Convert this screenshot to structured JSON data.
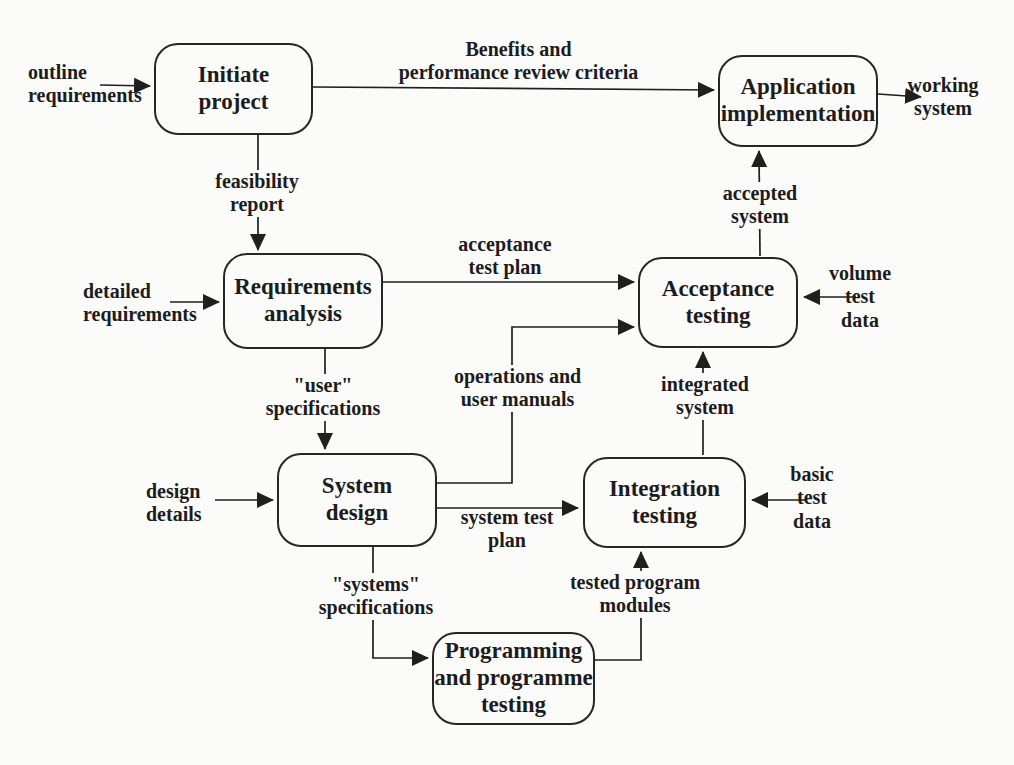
{
  "colors": {
    "ink": "#1f1f1f",
    "background": "#fbfbf9",
    "box_border": "#262626"
  },
  "nodes": {
    "initiate": {
      "label": "Initiate\nproject"
    },
    "application": {
      "label": "Application\nimplementation"
    },
    "requirements": {
      "label": "Requirements\nanalysis"
    },
    "acceptance": {
      "label": "Acceptance\ntesting"
    },
    "system_design": {
      "label": "System\ndesign"
    },
    "integration": {
      "label": "Integration\ntesting"
    },
    "programming": {
      "label": "Programming\nand programme\ntesting"
    }
  },
  "edge_labels": {
    "outline_requirements": "outline\nrequirements",
    "benefits": "Benefits and\nperformance review criteria",
    "working_system": "working\nsystem",
    "feasibility_report": "feasibility\nreport",
    "detailed_requirements": "detailed\nrequirements",
    "acceptance_test_plan": "acceptance\ntest plan",
    "user_specifications": "\"user\"\nspecifications",
    "design_details": "design\ndetails",
    "operations_user_manuals": "operations and\nuser manuals",
    "system_test_plan": "system test\nplan",
    "integrated_system": "integrated\nsystem",
    "accepted_system": "accepted\nsystem",
    "volume_test_data": "volume\ntest\ndata",
    "basic_test_data": "basic\ntest\ndata",
    "systems_specifications": "\"systems\"\nspecifications",
    "tested_program_modules": "tested program\nmodules"
  },
  "edges": [
    {
      "from": "external",
      "to": "initiate",
      "label": "outline requirements"
    },
    {
      "from": "initiate",
      "to": "application",
      "label": "Benefits and performance review criteria"
    },
    {
      "from": "application",
      "to": "external",
      "label": "working system"
    },
    {
      "from": "initiate",
      "to": "requirements",
      "label": "feasibility report"
    },
    {
      "from": "external",
      "to": "requirements",
      "label": "detailed requirements"
    },
    {
      "from": "requirements",
      "to": "acceptance",
      "label": "acceptance test plan"
    },
    {
      "from": "requirements",
      "to": "system_design",
      "label": "\"user\" specifications"
    },
    {
      "from": "external",
      "to": "system_design",
      "label": "design details"
    },
    {
      "from": "system_design",
      "to": "acceptance",
      "label": "operations and user manuals"
    },
    {
      "from": "system_design",
      "to": "integration",
      "label": "system test plan"
    },
    {
      "from": "system_design",
      "to": "programming",
      "label": "\"systems\" specifications"
    },
    {
      "from": "programming",
      "to": "integration",
      "label": "tested program modules"
    },
    {
      "from": "external",
      "to": "integration",
      "label": "basic test data"
    },
    {
      "from": "integration",
      "to": "acceptance",
      "label": "integrated system"
    },
    {
      "from": "external",
      "to": "acceptance",
      "label": "volume test data"
    },
    {
      "from": "acceptance",
      "to": "application",
      "label": "accepted system"
    }
  ]
}
